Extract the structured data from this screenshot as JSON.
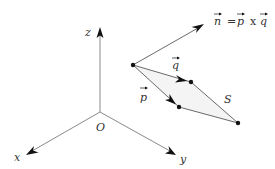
{
  "diagram": {
    "colors": {
      "axis": "#8a8a8a",
      "vector": "#6a6a6a",
      "arrowhead": "#111111",
      "label": "#333333",
      "parallelogram_fill": "#f4f4f4"
    },
    "axes": {
      "origin_label": "O",
      "x_label": "x",
      "y_label": "y",
      "z_label": "z"
    },
    "vectors": {
      "n_label": "n",
      "p_label": "p",
      "q_label": "q",
      "equation": {
        "lhs": "n",
        "equals": "=",
        "a": "p",
        "op": "x",
        "b": "q"
      }
    },
    "region_label": "S"
  }
}
